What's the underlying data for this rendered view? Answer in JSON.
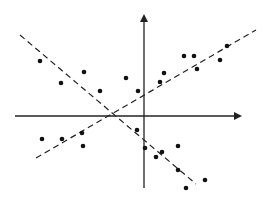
{
  "chart_data": {
    "type": "scatter",
    "title": "",
    "xlabel": "",
    "ylabel": "",
    "grid": false,
    "legend": null,
    "axes": {
      "color": "#222222",
      "x_axis": {
        "x1": 15,
        "y1": 116,
        "x2": 240,
        "y2": 116,
        "arrow": "right"
      },
      "y_axis": {
        "x1": 144,
        "y1": 188,
        "x2": 16,
        "y2": 16,
        "arrow": "up"
      }
    },
    "lines": [
      {
        "name": "negative-trend-line",
        "style": "dashed",
        "x1": 20,
        "y1": 35,
        "x2": 196,
        "y2": 184
      },
      {
        "name": "positive-trend-line",
        "style": "dashed",
        "x1": 36,
        "y1": 158,
        "x2": 256,
        "y2": 30
      }
    ],
    "points_pixel": [
      [
        40,
        61
      ],
      [
        61,
        83
      ],
      [
        84,
        72
      ],
      [
        100,
        91
      ],
      [
        126,
        78
      ],
      [
        138,
        91
      ],
      [
        160,
        82
      ],
      [
        164,
        73
      ],
      [
        184,
        56
      ],
      [
        194,
        56
      ],
      [
        197,
        69
      ],
      [
        220,
        60
      ],
      [
        227,
        46
      ],
      [
        42,
        139
      ],
      [
        62,
        139
      ],
      [
        82,
        133
      ],
      [
        83,
        146
      ],
      [
        137,
        130
      ],
      [
        145,
        148
      ],
      [
        156,
        157
      ],
      [
        162,
        152
      ],
      [
        178,
        146
      ],
      [
        178,
        170
      ],
      [
        186,
        188
      ],
      [
        205,
        180
      ]
    ],
    "points_relative_to_origin": [
      [
        -104,
        55
      ],
      [
        -83,
        33
      ],
      [
        -60,
        44
      ],
      [
        -44,
        25
      ],
      [
        -18,
        38
      ],
      [
        -6,
        25
      ],
      [
        16,
        34
      ],
      [
        20,
        43
      ],
      [
        40,
        60
      ],
      [
        50,
        60
      ],
      [
        53,
        47
      ],
      [
        76,
        56
      ],
      [
        83,
        70
      ],
      [
        -102,
        -23
      ],
      [
        -82,
        -23
      ],
      [
        -62,
        -17
      ],
      [
        -61,
        -30
      ],
      [
        -7,
        -14
      ],
      [
        1,
        -32
      ],
      [
        12,
        -41
      ],
      [
        18,
        -36
      ],
      [
        34,
        -30
      ],
      [
        34,
        -54
      ],
      [
        42,
        -72
      ],
      [
        61,
        -64
      ]
    ],
    "colors": {
      "points": "#111111",
      "lines": "#222222",
      "background": "#ffffff"
    }
  }
}
